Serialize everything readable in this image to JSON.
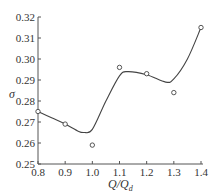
{
  "chart_data": {
    "type": "scatter",
    "title": "",
    "xlabel": "Q/Q_d",
    "xlabel_main": "Q/Q",
    "xlabel_sub": "d",
    "ylabel": "σ",
    "xlim": [
      0.8,
      1.4
    ],
    "ylim": [
      0.25,
      0.32
    ],
    "x_ticks": [
      "0.8",
      "0.9",
      "1.0",
      "1.1",
      "1.2",
      "1.3",
      "1.4"
    ],
    "y_ticks": [
      "0.25",
      "0.26",
      "0.27",
      "0.28",
      "0.29",
      "0.30",
      "0.31",
      "0.32"
    ],
    "grid": false,
    "legend": null,
    "series": [
      {
        "name": "measured",
        "style": "hollow-circle-markers",
        "x": [
          0.8,
          0.9,
          1.0,
          1.1,
          1.2,
          1.3,
          1.4
        ],
        "y": [
          0.275,
          0.269,
          0.259,
          0.296,
          0.293,
          0.284,
          0.315
        ]
      },
      {
        "name": "fitted curve",
        "style": "smooth-line",
        "x": [
          0.8,
          0.85,
          0.9,
          0.95,
          0.97,
          1.0,
          1.05,
          1.1,
          1.13,
          1.2,
          1.27,
          1.3,
          1.35,
          1.4
        ],
        "y": [
          0.275,
          0.272,
          0.269,
          0.2655,
          0.265,
          0.2665,
          0.28,
          0.292,
          0.294,
          0.2925,
          0.289,
          0.2905,
          0.3,
          0.315
        ]
      }
    ]
  },
  "colors": {
    "axis": "#555555",
    "line": "#444444",
    "marker": "#444444",
    "background": "#ffffff"
  }
}
